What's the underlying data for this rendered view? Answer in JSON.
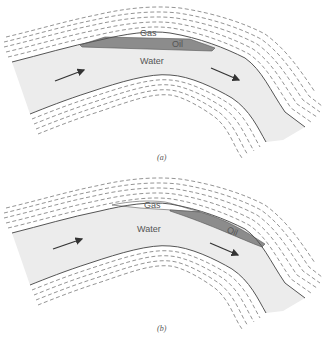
{
  "figure": {
    "panels": [
      {
        "id": "a",
        "caption": "(a)",
        "labels": {
          "gas": "Gas",
          "oil": "Oil",
          "water": "Water"
        },
        "description": "Oil and gas trapped at anticline crest above flowing water"
      },
      {
        "id": "b",
        "caption": "(b)",
        "labels": {
          "gas": "Gas",
          "oil": "Oil",
          "water": "Water"
        },
        "description": "Hydrodynamic trap: oil displaced down-flank in flow direction"
      }
    ],
    "colors": {
      "water": "#ececec",
      "oil": "#8c8c8c",
      "gas": "#ffffff",
      "boundary": "#555555",
      "strata": "#666666",
      "arrow": "#333333"
    }
  }
}
